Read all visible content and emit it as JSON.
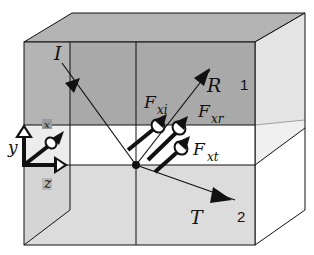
{
  "diagram": {
    "media": [
      {
        "id": "1",
        "label": "1",
        "region": "upper",
        "fill": "#a9a9a9"
      },
      {
        "id": "2",
        "label": "2",
        "region": "lower",
        "fill": "#dcdcdc"
      }
    ],
    "interface_layer_fill": "#ffffff",
    "rays": [
      {
        "id": "I",
        "label": "I",
        "kind": "incident"
      },
      {
        "id": "R",
        "label": "R",
        "kind": "reflected"
      },
      {
        "id": "T",
        "label": "T",
        "kind": "transmitted"
      }
    ],
    "field_vectors": [
      {
        "id": "F_xi",
        "label_main": "F",
        "label_sub": "xi"
      },
      {
        "id": "F_xr",
        "label_main": "F",
        "label_sub": "xr"
      },
      {
        "id": "F_xt",
        "label_main": "F",
        "label_sub": "xt"
      }
    ],
    "axes": [
      {
        "id": "y",
        "label": "y"
      },
      {
        "id": "z",
        "label": "z"
      },
      {
        "id": "x",
        "label": "x"
      }
    ],
    "colors": {
      "line": "#111111",
      "medium1": "#a9a9a9",
      "medium1_top": "#b4b4b4",
      "medium2": "#dcdcdc",
      "side_light": "#e8e8e8",
      "side_white": "#ffffff"
    }
  }
}
